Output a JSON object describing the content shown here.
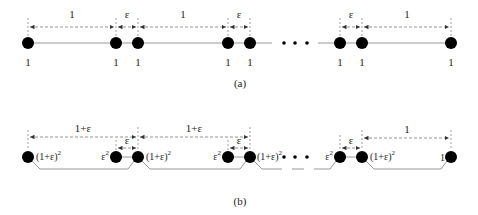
{
  "figure": {
    "panel_a": {
      "caption": "(a)",
      "spacing_labels": [
        "1",
        "ε",
        "1",
        "ε",
        "ε",
        "1"
      ],
      "node_labels": [
        "1",
        "1",
        "1",
        "1",
        "1",
        "1",
        "1",
        "1"
      ],
      "ellipsis": "• • •"
    },
    "panel_b": {
      "caption": "(b)",
      "spacing_labels": [
        "1+ε",
        "ε",
        "1+ε",
        "ε",
        "ε",
        "1"
      ],
      "weight_big": "(1+ε)",
      "weight_big_exp": "2",
      "weight_small": "ε",
      "weight_small_exp": "2",
      "weight_last": "1",
      "ellipsis": "• • •"
    },
    "colors": {
      "node": "#000000",
      "line": "#999999",
      "dash": "#888888",
      "text": "#222222"
    }
  }
}
